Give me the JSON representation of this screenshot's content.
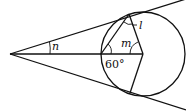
{
  "diagram": {
    "labels": {
      "n": "n",
      "m": "m",
      "l": "l",
      "angle_60": "60°"
    },
    "colors": {
      "stroke": "#111111",
      "background": "#ffffff"
    }
  }
}
